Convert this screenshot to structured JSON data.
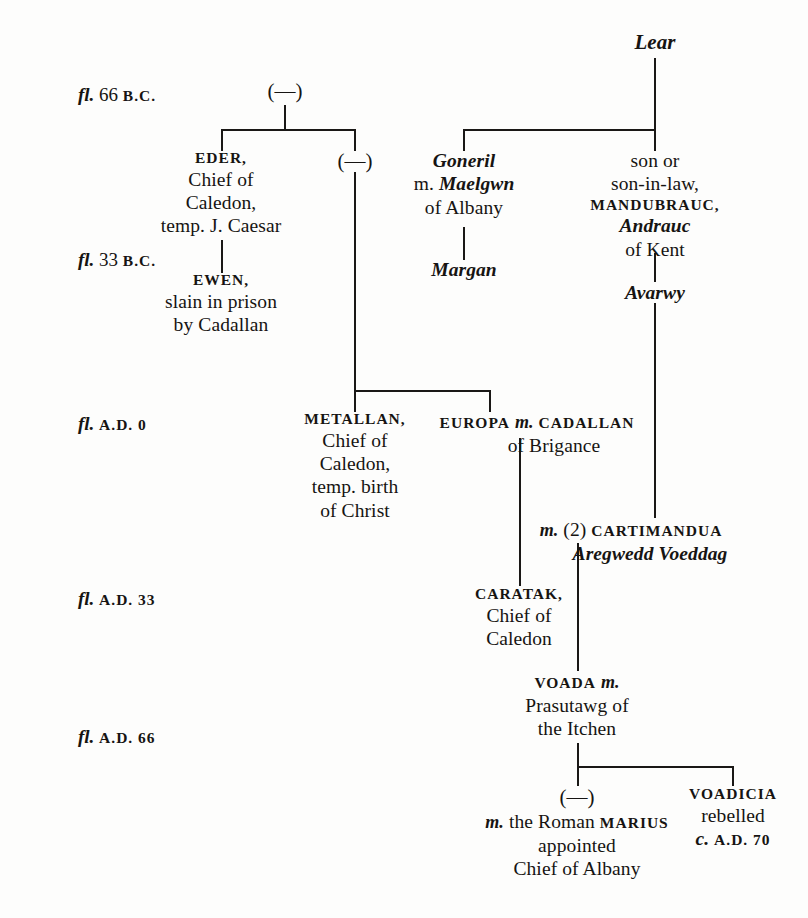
{
  "document": {
    "kind": "genealogical-chart",
    "title": "",
    "background_color": "#fdfdfc",
    "ink_color": "#161412"
  },
  "date_rail": {
    "label_prefix": "fl.",
    "items": [
      {
        "id": "d1",
        "prefix": "fl.",
        "number": "66",
        "era": "B.C.",
        "full": "fl. 66 B.C."
      },
      {
        "id": "d2",
        "prefix": "fl.",
        "number": "33",
        "era": "B.C.",
        "full": "fl. 33 B.C."
      },
      {
        "id": "d3",
        "prefix": "fl.",
        "number": "",
        "era": "A.D. 0",
        "full": "fl. A.D. 0"
      },
      {
        "id": "d4",
        "prefix": "fl.",
        "number": "",
        "era": "A.D. 33",
        "full": "fl. A.D. 33"
      },
      {
        "id": "d5",
        "prefix": "fl.",
        "number": "",
        "era": "A.D. 66",
        "full": "fl. A.D. 66"
      }
    ]
  },
  "nodes": {
    "unknown_top": {
      "glyph": "(—)"
    },
    "eder": {
      "name": "EDER,",
      "line2": "Chief of",
      "line3": "Caledon,",
      "line4": "temp. J. Caesar"
    },
    "unknown_second": {
      "glyph": "(—)"
    },
    "ewen": {
      "name": "EWEN,",
      "line2": "slain in prison",
      "line3": "by Cadallan"
    },
    "lear": {
      "name": "Lear"
    },
    "goneril": {
      "name": "Goneril",
      "marriage_marker": "m.",
      "spouse": "Maelgwn",
      "line3": "of Albany"
    },
    "margan": {
      "name": "Margan"
    },
    "mandubrauc": {
      "line1": "son or",
      "line2": "son-in-law,",
      "name": "MANDUBRAUC,",
      "alt_name": "Andrauc",
      "line5": "of Kent"
    },
    "avarwy": {
      "name": "Avarwy"
    },
    "metallan": {
      "name": "METALLAN,",
      "line2": "Chief of",
      "line3": "Caledon,",
      "line4": "temp. birth",
      "line5": "of Christ"
    },
    "europa_cadallan": {
      "name": "EUROPA",
      "marriage_marker": "m.",
      "spouse": "CADALLAN",
      "line2": "of Brigance"
    },
    "cartimandua": {
      "marriage_marker": "m.",
      "ordinal": "(2)",
      "name": "CARTIMANDUA",
      "alt_name": "Aregwedd Voeddag"
    },
    "caratak": {
      "name": "CARATAK,",
      "line2": "Chief of",
      "line3": "Caledon"
    },
    "voada": {
      "name": "VOADA",
      "marriage_marker": "m.",
      "line2": "Prasutawg of",
      "line3": "the Itchen"
    },
    "unknown_daughter": {
      "glyph": "(—)",
      "marriage_marker": "m.",
      "line2_pre": "the Roman",
      "spouse": "MARIUS",
      "line3": "appointed",
      "line4": "Chief of Albany"
    },
    "voadicia": {
      "name": "VOADICIA",
      "line2": "rebelled",
      "circa": "c.",
      "line3": "A.D. 70"
    }
  }
}
